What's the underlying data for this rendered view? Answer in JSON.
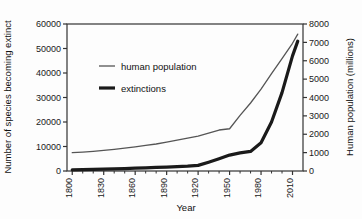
{
  "chart_data": {
    "type": "line",
    "title": "",
    "xlabel": "Year",
    "ylabel": "Number of species becoming extinct",
    "ylabel_right": "Human population (millions)",
    "xlim": [
      1795,
      2020
    ],
    "ylim": [
      0,
      60000
    ],
    "ylim_right": [
      0,
      8000
    ],
    "grid": false,
    "legend_position": "upper-left-inside",
    "x_ticks": [
      "1800",
      "1830",
      "1860",
      "1890",
      "1920",
      "1950",
      "1980",
      "2010"
    ],
    "x_tick_values": [
      1800,
      1830,
      1860,
      1890,
      1920,
      1950,
      1980,
      2010
    ],
    "x_minor_tick_interval": 10,
    "y_ticks_left": [
      "0",
      "10000",
      "20000",
      "30000",
      "40000",
      "50000",
      "60000"
    ],
    "y_tick_values_left": [
      0,
      10000,
      20000,
      30000,
      40000,
      50000,
      60000
    ],
    "y_ticks_right": [
      "0",
      "1000",
      "2000",
      "3000",
      "4000",
      "5000",
      "6000",
      "7000",
      "8000"
    ],
    "y_tick_values_right": [
      0,
      1000,
      2000,
      3000,
      4000,
      5000,
      6000,
      7000,
      8000
    ],
    "series": [
      {
        "name": "human population",
        "axis": "right",
        "units": "millions",
        "color": "#555555",
        "line_width": 1.3,
        "x": [
          1800,
          1810,
          1820,
          1830,
          1840,
          1850,
          1860,
          1870,
          1880,
          1890,
          1900,
          1910,
          1920,
          1930,
          1940,
          1950,
          1960,
          1970,
          1980,
          1990,
          2000,
          2010,
          2015
        ],
        "values": [
          1000,
          1030,
          1070,
          1120,
          1180,
          1240,
          1310,
          1390,
          1470,
          1570,
          1680,
          1790,
          1900,
          2060,
          2230,
          2300,
          3030,
          3700,
          4450,
          5300,
          6120,
          6950,
          7450
        ]
      },
      {
        "name": "extinctions",
        "axis": "left",
        "units": "species",
        "color": "#1a1a1a",
        "line_width": 3.2,
        "x": [
          1800,
          1810,
          1820,
          1830,
          1840,
          1850,
          1860,
          1870,
          1880,
          1890,
          1900,
          1910,
          1920,
          1930,
          1940,
          1950,
          1960,
          1970,
          1980,
          1990,
          2000,
          2010,
          2015
        ],
        "values": [
          500,
          600,
          700,
          800,
          900,
          1000,
          1150,
          1300,
          1450,
          1600,
          1800,
          2000,
          2300,
          3600,
          5000,
          6500,
          7400,
          8000,
          11500,
          20000,
          32000,
          47000,
          53000
        ]
      }
    ],
    "legend": [
      {
        "label": "human population",
        "color": "#555555",
        "line_width": 1.3
      },
      {
        "label": "extinctions",
        "color": "#1a1a1a",
        "line_width": 3.2
      }
    ]
  },
  "style": {
    "axis_color": "#333333",
    "background": "#ffffff"
  }
}
